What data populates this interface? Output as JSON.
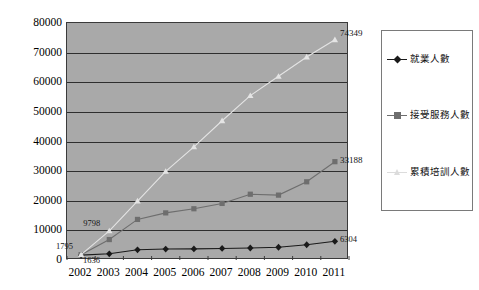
{
  "chart_data": {
    "type": "line",
    "title": "",
    "xlabel": "",
    "ylabel": "",
    "categories": [
      "2002",
      "2003",
      "2004",
      "2005",
      "2006",
      "2007",
      "2008",
      "2009",
      "2010",
      "2011"
    ],
    "ylim": [
      0,
      80000
    ],
    "y_ticks": [
      "0",
      "10000",
      "20000",
      "30000",
      "40000",
      "50000",
      "60000",
      "70000",
      "80000"
    ],
    "y_tick_values": [
      0,
      10000,
      20000,
      30000,
      40000,
      50000,
      60000,
      70000,
      80000
    ],
    "grid": true,
    "legend_position": "right",
    "series": [
      {
        "name": "就業人數",
        "marker": "diamond",
        "color": "#1a1a1a",
        "values": [
          1636,
          2100,
          3450,
          3700,
          3750,
          3900,
          4050,
          4300,
          5150,
          6304
        ]
      },
      {
        "name": "接受服務人數",
        "marker": "square",
        "color": "#6e6e6e",
        "values": [
          1795,
          6900,
          13700,
          15900,
          17300,
          19100,
          22200,
          21900,
          26400,
          33188
        ]
      },
      {
        "name": "累積培訓人數",
        "marker": "triangle",
        "color": "#e4e4e4",
        "values": [
          1795,
          9798,
          19900,
          29900,
          38200,
          47000,
          55500,
          62000,
          68500,
          74349
        ]
      }
    ],
    "annotations": [
      {
        "text": "1795",
        "series": "接受服務人數",
        "category": "2002",
        "dx": -24,
        "dy": -12
      },
      {
        "text": "1636",
        "series": "就業人數",
        "category": "2002",
        "dx": 3,
        "dy": 2
      },
      {
        "text": "9798",
        "series": "累積培訓人數",
        "category": "2003",
        "dx": -25,
        "dy": -11
      },
      {
        "text": "74349",
        "series": "累積培訓人數",
        "category": "2011",
        "dx": 6,
        "dy": -10
      },
      {
        "text": "33188",
        "series": "接受服務人數",
        "category": "2011",
        "dx": 6,
        "dy": -5
      },
      {
        "text": "6304",
        "series": "就業人數",
        "category": "2011",
        "dx": 6,
        "dy": -5
      }
    ]
  },
  "legend": {
    "items": [
      {
        "label": "就業人數",
        "color": "#1a1a1a",
        "marker": "diamond"
      },
      {
        "label": "接受服務人數",
        "color": "#6e6e6e",
        "marker": "square"
      },
      {
        "label": "累積培訓人數",
        "color": "#dcdcdc",
        "marker": "triangle"
      }
    ]
  },
  "colors": {
    "plot_background": "#a9a9a9",
    "page_background": "#ffffff",
    "gridline": "#2e2e2e",
    "axis": "#3a3a3a"
  }
}
